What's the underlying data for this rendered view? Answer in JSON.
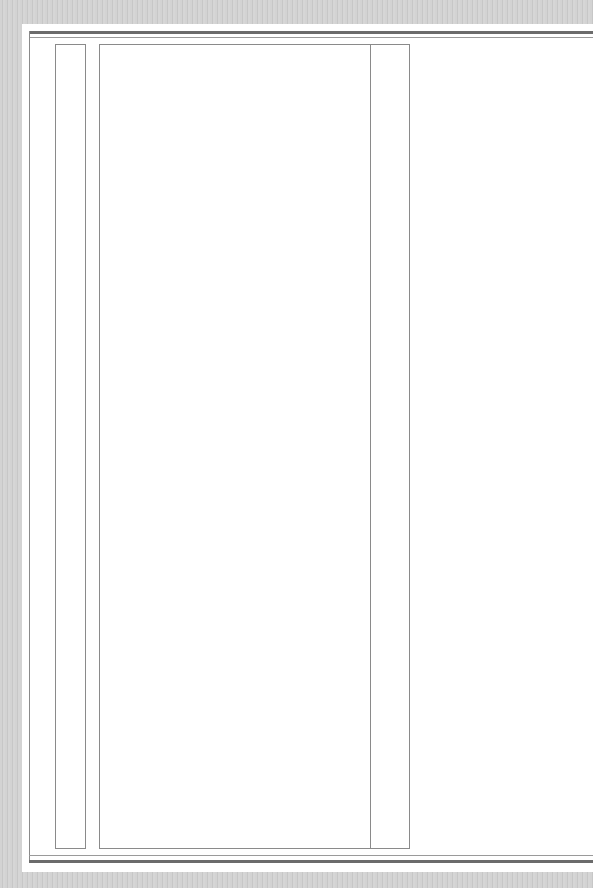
{
  "document": {
    "type": "blank ruled form page",
    "colors": {
      "paper": "#ffffff",
      "background_scan": "#cfcfcf",
      "rule_dark": "#6b6b6b",
      "rule_light": "#8a8a8a"
    }
  }
}
